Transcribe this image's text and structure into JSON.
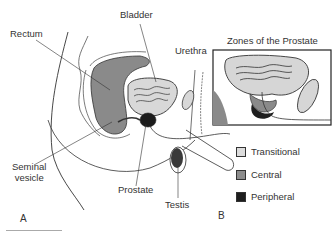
{
  "panel_a": {
    "label": "A",
    "labels": {
      "rectum": "Rectum",
      "bladder": "Bladder",
      "urethra": "Urethra",
      "seminal_vesicle_line1": "Seminal",
      "seminal_vesicle_line2": "vesicle",
      "prostate": "Prostate",
      "testis": "Testis"
    }
  },
  "panel_b": {
    "label": "B",
    "title": "Zones of the Prostate",
    "legend": [
      {
        "label": "Transitional",
        "color": "#dcdcdc"
      },
      {
        "label": "Central",
        "color": "#8c8c8c"
      },
      {
        "label": "Peripheral",
        "color": "#1e1e1e"
      }
    ]
  }
}
